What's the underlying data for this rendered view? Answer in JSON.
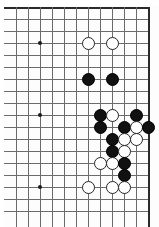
{
  "document": {
    "kind": "go-board-diagram",
    "title": "Go board position diagram",
    "alt_text": "Partial Go board showing a black and white stone fight near the right side"
  },
  "board": {
    "name": "go-board",
    "origin_x": 16,
    "origin_y": 7,
    "cell": 12,
    "columns": 12,
    "rows": 18,
    "line_color": "#6b6b6b",
    "edge_color": "#2a2a2a",
    "background_color": "#ffffff",
    "right_edge_column": 11,
    "top_edge_row": 0,
    "star_point_color": "#1c1c1c",
    "star_points": [
      {
        "col": 2,
        "row": 3
      },
      {
        "col": 2,
        "row": 9
      },
      {
        "col": 2,
        "row": 15
      }
    ]
  },
  "stones": {
    "black_color": "#111111",
    "white_color": "#ffffff",
    "white_outline_color": "#262626",
    "black_count": 13,
    "white_count": 13,
    "items": [
      {
        "col": 6,
        "row": 3,
        "color": "white"
      },
      {
        "col": 8,
        "row": 3,
        "color": "white"
      },
      {
        "col": 6,
        "row": 6,
        "color": "black"
      },
      {
        "col": 8,
        "row": 6,
        "color": "black"
      },
      {
        "col": 7,
        "row": 9,
        "color": "black"
      },
      {
        "col": 8,
        "row": 9,
        "color": "white"
      },
      {
        "col": 10,
        "row": 9,
        "color": "black"
      },
      {
        "col": 7,
        "row": 10,
        "color": "black"
      },
      {
        "col": 9,
        "row": 10,
        "color": "black"
      },
      {
        "col": 10,
        "row": 10,
        "color": "white"
      },
      {
        "col": 11,
        "row": 10,
        "color": "black"
      },
      {
        "col": 8,
        "row": 11,
        "color": "black"
      },
      {
        "col": 9,
        "row": 11,
        "color": "white"
      },
      {
        "col": 10,
        "row": 11,
        "color": "white"
      },
      {
        "col": 8,
        "row": 12,
        "color": "black"
      },
      {
        "col": 9,
        "row": 12,
        "color": "white"
      },
      {
        "col": 7,
        "row": 13,
        "color": "white"
      },
      {
        "col": 8,
        "row": 13,
        "color": "white"
      },
      {
        "col": 9,
        "row": 13,
        "color": "black"
      },
      {
        "col": 9,
        "row": 14,
        "color": "black"
      },
      {
        "col": 6,
        "row": 15,
        "color": "white"
      },
      {
        "col": 8,
        "row": 15,
        "color": "white"
      },
      {
        "col": 9,
        "row": 15,
        "color": "white"
      }
    ]
  }
}
